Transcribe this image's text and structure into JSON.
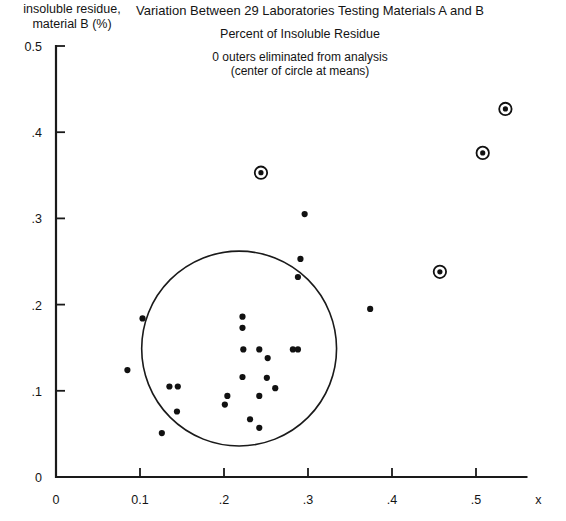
{
  "chart_data": {
    "type": "scatter",
    "title": "Variation Between 29 Laboratories Testing Materials A and B",
    "subtitle": "Percent of Insoluble Residue",
    "annotations": [
      "0 outers eliminated from analysis",
      "(center of circle at means)"
    ],
    "ylabel_line1": "insoluble residue,",
    "ylabel_line2": "material B (%)",
    "xlabel_axis_symbol": "x",
    "xlim": [
      0,
      0.56
    ],
    "ylim": [
      0,
      0.5
    ],
    "grid": false,
    "legend": "none",
    "xticks": [
      {
        "value": 0,
        "label": "0"
      },
      {
        "value": 0.1,
        "label": "0.1"
      },
      {
        "value": 0.2,
        "label": ".2"
      },
      {
        "value": 0.3,
        "label": ".3"
      },
      {
        "value": 0.4,
        "label": ".4"
      },
      {
        "value": 0.5,
        "label": ".5"
      }
    ],
    "yticks": [
      {
        "value": 0,
        "label": "0"
      },
      {
        "value": 0.1,
        "label": ".1"
      },
      {
        "value": 0.2,
        "label": ".2"
      },
      {
        "value": 0.3,
        "label": ".3"
      },
      {
        "value": 0.4,
        "label": ".4"
      },
      {
        "value": 0.5,
        "label": "0.5"
      }
    ],
    "reference_circle": {
      "center_x": 0.218,
      "center_y": 0.149,
      "radius_x": 0.116,
      "radius_y": 0.113,
      "note": "center of circle at means"
    },
    "series": [
      {
        "name": "laboratories",
        "marker": "filled-dot",
        "points": [
          {
            "x": 0.103,
            "y": 0.184
          },
          {
            "x": 0.085,
            "y": 0.124
          },
          {
            "x": 0.135,
            "y": 0.105
          },
          {
            "x": 0.145,
            "y": 0.105
          },
          {
            "x": 0.144,
            "y": 0.076
          },
          {
            "x": 0.126,
            "y": 0.051
          },
          {
            "x": 0.222,
            "y": 0.186
          },
          {
            "x": 0.222,
            "y": 0.173
          },
          {
            "x": 0.223,
            "y": 0.148
          },
          {
            "x": 0.242,
            "y": 0.148
          },
          {
            "x": 0.282,
            "y": 0.148
          },
          {
            "x": 0.288,
            "y": 0.148
          },
          {
            "x": 0.252,
            "y": 0.138
          },
          {
            "x": 0.222,
            "y": 0.116
          },
          {
            "x": 0.251,
            "y": 0.115
          },
          {
            "x": 0.261,
            "y": 0.103
          },
          {
            "x": 0.204,
            "y": 0.094
          },
          {
            "x": 0.242,
            "y": 0.094
          },
          {
            "x": 0.201,
            "y": 0.084
          },
          {
            "x": 0.231,
            "y": 0.067
          },
          {
            "x": 0.242,
            "y": 0.057
          },
          {
            "x": 0.291,
            "y": 0.253
          },
          {
            "x": 0.296,
            "y": 0.305
          },
          {
            "x": 0.374,
            "y": 0.195
          },
          {
            "x": 0.288,
            "y": 0.232
          }
        ]
      },
      {
        "name": "outer-laboratories",
        "marker": "dot-with-ring",
        "points": [
          {
            "x": 0.244,
            "y": 0.353
          },
          {
            "x": 0.457,
            "y": 0.238
          },
          {
            "x": 0.508,
            "y": 0.376
          },
          {
            "x": 0.535,
            "y": 0.427
          }
        ]
      }
    ]
  },
  "geometry": {
    "origin_px": {
      "x": 56,
      "y": 477
    },
    "x_scale_px_per_unit": 840,
    "y_scale_px_per_unit": 862
  }
}
